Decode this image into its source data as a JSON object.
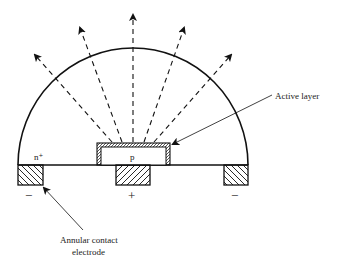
{
  "diagram": {
    "type": "LED cross-section with hemispherical dome",
    "labels": {
      "n_region": "n⁺",
      "p_region": "p",
      "active_layer": "Active layer",
      "electrode_line1": "Annular contact",
      "electrode_line2": "electrode"
    },
    "polarity": {
      "left": "−",
      "center": "+",
      "right": "−"
    },
    "colors": {
      "line": "#111111",
      "background": "#ffffff"
    },
    "emission_arrows": 5
  }
}
